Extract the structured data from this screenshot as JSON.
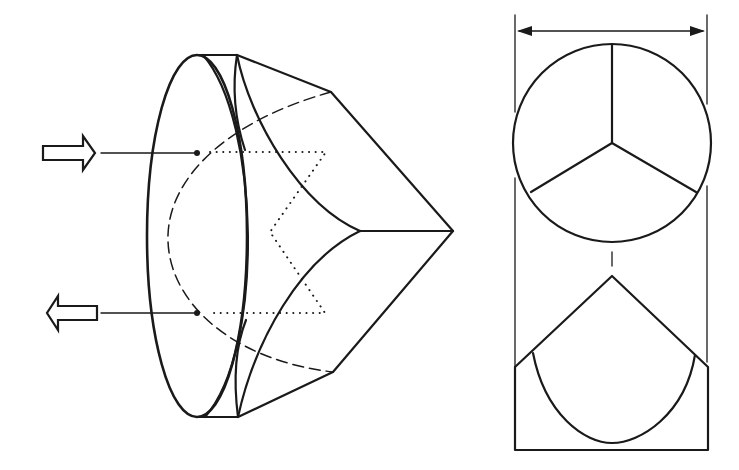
{
  "figure": {
    "views": [
      {
        "id": "perspective-view",
        "description": "Perspective view of corner cube prism with circular entrance face"
      },
      {
        "id": "front-view",
        "description": "Front view: circle divided into three sectors by edges meeting at center"
      },
      {
        "id": "side-view",
        "description": "Side view: pointed apex with curved cylindrical edge outline"
      }
    ],
    "beams": [
      {
        "id": "incoming-beam",
        "direction": "in"
      },
      {
        "id": "outgoing-beam",
        "direction": "out"
      }
    ],
    "dimension": {
      "id": "diameter-dimension",
      "label": ""
    },
    "colors": {
      "line": "#1a1a1a",
      "background": "#ffffff"
    }
  }
}
